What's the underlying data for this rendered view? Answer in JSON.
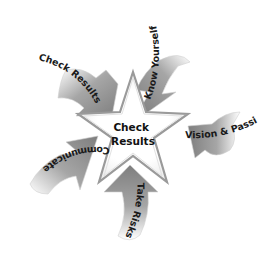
{
  "diagram": {
    "center": {
      "line1": "Check",
      "line2": "Results"
    },
    "arrows": [
      {
        "label": "Know Yourself",
        "position": "top-right"
      },
      {
        "label": "Vision & Passion",
        "position": "right"
      },
      {
        "label": "Take Risks",
        "position": "bottom"
      },
      {
        "label": "Communicate",
        "position": "left"
      },
      {
        "label": "Check Results",
        "position": "top-left"
      }
    ]
  },
  "colors": {
    "arrow_dark": "#8a8a8a",
    "arrow_light": "#ffffff",
    "star_fill": "#ffffff",
    "star_edge": "#9a9a9a",
    "text": "#1a1a1a"
  }
}
